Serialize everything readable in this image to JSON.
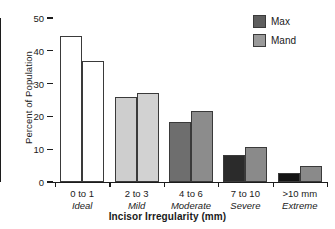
{
  "chart_data": {
    "type": "bar",
    "title": "",
    "xlabel": "Incisor Irregularity (mm)",
    "ylabel": "Percent of Population",
    "categories": [
      "0 to 1",
      "2 to 3",
      "4 to 6",
      "7 to 10",
      ">10 mm"
    ],
    "category_names": [
      "Ideal",
      "Mild",
      "Moderate",
      "Severe",
      "Extreme"
    ],
    "series": [
      {
        "name": "Max",
        "values": [
          44.5,
          25.8,
          18.3,
          8.3,
          2.9
        ]
      },
      {
        "name": "Mand",
        "values": [
          36.8,
          27.2,
          21.8,
          10.8,
          4.9
        ]
      }
    ],
    "ylim": [
      0,
      50
    ],
    "yticks": [
      0,
      10,
      20,
      30,
      40,
      50
    ],
    "ytick_labels": [
      "0",
      "10",
      "20",
      "30",
      "40",
      "50"
    ],
    "grid": false,
    "legend_position": "top-right",
    "bar_colors": [
      {
        "max": "#ffffff",
        "mand": "#ffffff"
      },
      {
        "max": "#cecece",
        "mand": "#d2d2d2"
      },
      {
        "max": "#6e6e6e",
        "mand": "#8c8c8c"
      },
      {
        "max": "#2b2b2b",
        "mand": "#8a8a8a"
      },
      {
        "max": "#141414",
        "mand": "#8a8a8a"
      }
    ],
    "bar_outline_color": "#3a3a3a",
    "axis_color": "#1c1c1c"
  },
  "legend": {
    "items": [
      {
        "label": "Max",
        "color": "#5e5e5e"
      },
      {
        "label": "Mand",
        "color": "#9a9a9a"
      }
    ]
  },
  "axes": {
    "y_title": "Percent of Population",
    "x_title": "Incisor Irregularity (mm)"
  }
}
